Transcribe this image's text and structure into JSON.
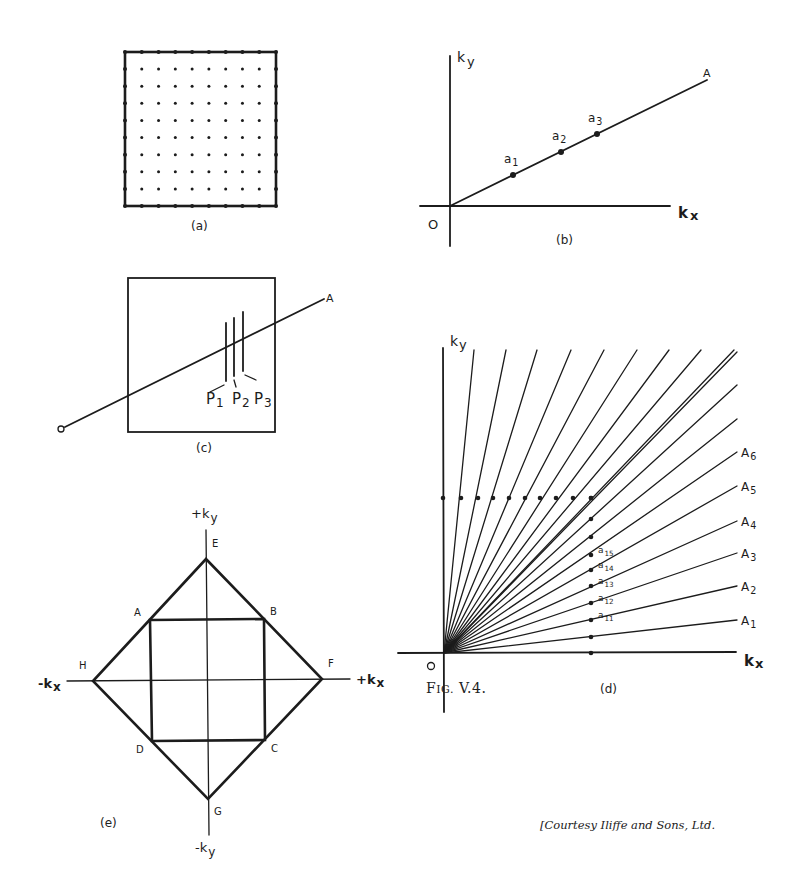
{
  "figure": {
    "title_prefix": "F",
    "title_smallcaps": "IG.",
    "title_number": " V.4.",
    "courtesy": "[Courtesy Iliffe and Sons, Ltd."
  },
  "panels": {
    "a": {
      "caption": "(a)",
      "box": {
        "x1": 125,
        "y1": 52,
        "x2": 276,
        "y2": 206
      },
      "grid_count": 10,
      "description": "square lattice of k-space points with boundary dots"
    },
    "b": {
      "caption": "(b)",
      "origin_label": "O",
      "x_axis_label": "kx",
      "y_axis_label": "ky",
      "line_label": "A",
      "origin": {
        "x": 450,
        "y": 206
      },
      "line_end": {
        "x": 707,
        "y": 80
      },
      "points": [
        {
          "label": "a",
          "sub": "1",
          "x": 513,
          "y": 175
        },
        {
          "label": "a",
          "sub": "2",
          "x": 561,
          "y": 152
        },
        {
          "label": "a",
          "sub": "3",
          "x": 597,
          "y": 134
        }
      ]
    },
    "c": {
      "caption": "(c)",
      "origin_label": "O",
      "line_label": "A",
      "box": {
        "x1": 128,
        "y1": 278,
        "x2": 275,
        "y2": 432
      },
      "planes": [
        {
          "label": "P",
          "sub": "1",
          "x": 226,
          "y1": 323,
          "y2": 381
        },
        {
          "label": "P",
          "sub": "2",
          "x": 234,
          "y1": 318,
          "y2": 376
        },
        {
          "label": "P",
          "sub": "3",
          "x": 243,
          "y1": 312,
          "y2": 371
        }
      ]
    },
    "d": {
      "caption": "(d)",
      "origin_label": "O",
      "x_axis_label": "kx",
      "y_axis_label": "ky",
      "origin": {
        "x": 444,
        "y": 653
      },
      "top_line_ends_x": [
        474,
        506,
        537,
        571,
        604,
        637,
        669,
        701,
        734
      ],
      "right_line_ends_y": [
        352,
        385,
        419,
        452,
        486,
        521,
        553,
        586,
        620
      ],
      "ray_labels": [
        {
          "label": "A",
          "sub": "6",
          "y": 452
        },
        {
          "label": "A",
          "sub": "5",
          "y": 486
        },
        {
          "label": "A",
          "sub": "4",
          "y": 521
        },
        {
          "label": "A",
          "sub": "3",
          "y": 553
        },
        {
          "label": "A",
          "sub": "2",
          "y": 586
        },
        {
          "label": "A",
          "sub": "1",
          "y": 620
        }
      ],
      "point_labels": [
        {
          "label": "a",
          "sub": "15",
          "y": 555
        },
        {
          "label": "a",
          "sub": "14",
          "y": 570
        },
        {
          "label": "a",
          "sub": "13",
          "y": 586
        },
        {
          "label": "a",
          "sub": "12",
          "y": 603
        },
        {
          "label": "a",
          "sub": "11",
          "y": 620
        }
      ],
      "dot_row_y": 498,
      "dot_row_x": [
        443,
        461,
        478,
        493,
        509,
        525,
        540,
        556,
        573,
        591
      ],
      "dot_col_x": 591,
      "dot_col_y": [
        498,
        519,
        537,
        555,
        570,
        586,
        603,
        620,
        637,
        653
      ]
    },
    "e": {
      "caption": "(e)",
      "axis_labels": {
        "pos_y": "+ky",
        "neg_y": "-ky",
        "pos_x": "+kx",
        "neg_x": "-kx"
      },
      "vertices": {
        "E": {
          "x": 206,
          "y": 559
        },
        "F": {
          "x": 322,
          "y": 679
        },
        "G": {
          "x": 208,
          "y": 799
        },
        "H": {
          "x": 93,
          "y": 681
        },
        "A": {
          "x": 150,
          "y": 620
        },
        "B": {
          "x": 264,
          "y": 619
        },
        "C": {
          "x": 265,
          "y": 740
        },
        "D": {
          "x": 152,
          "y": 741
        }
      }
    }
  }
}
